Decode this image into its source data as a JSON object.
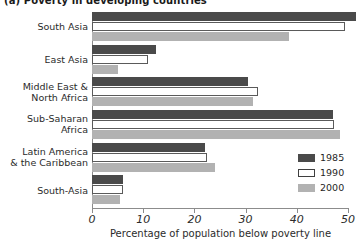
{
  "chart_data": {
    "type": "bar",
    "orientation": "horizontal",
    "title": "(a) Poverty in developing countries",
    "xlabel": "Percentage of population below poverty line",
    "ylabel": "",
    "xlim": [
      0,
      50
    ],
    "xticks": [
      0,
      10,
      20,
      30,
      40,
      50
    ],
    "xtick_labels": [
      "0",
      "10",
      "20",
      "30",
      "40",
      "50"
    ],
    "grid": false,
    "legend_position": "inside-right",
    "categories": [
      "South Asia",
      "East Asia",
      "Middle East &\nNorth Africa",
      "Sub-Saharan\nAfrica",
      "Latin America\n& the Caribbean",
      "South-Asia"
    ],
    "category_lines": [
      [
        "South Asia"
      ],
      [
        "East Asia"
      ],
      [
        "Middle East &",
        "North Africa"
      ],
      [
        "Sub-Saharan",
        "Africa"
      ],
      [
        "Latin America",
        "& the Caribbean"
      ],
      [
        "South-Asia"
      ]
    ],
    "series": [
      {
        "name": "1985",
        "color": "#4a4a4a",
        "values": [
          51.5,
          12.5,
          30.5,
          47.0,
          22.0,
          6.0
        ]
      },
      {
        "name": "1990",
        "color": "#ffffff",
        "values": [
          49.5,
          11.0,
          32.5,
          47.2,
          22.5,
          6.0
        ]
      },
      {
        "name": "2000",
        "color": "#b2b2b2",
        "values": [
          38.5,
          5.0,
          31.5,
          48.5,
          24.0,
          5.5
        ]
      }
    ]
  },
  "legend": {
    "items": [
      {
        "label": "1985",
        "swatch": "s1985"
      },
      {
        "label": "1990",
        "swatch": "s1990"
      },
      {
        "label": "2000",
        "swatch": "s2000"
      }
    ]
  }
}
